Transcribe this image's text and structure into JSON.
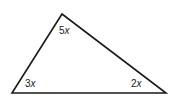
{
  "diagram": {
    "type": "triangle",
    "vertices": {
      "top": {
        "x": 62,
        "y": 14
      },
      "bottom_left": {
        "x": 12,
        "y": 93
      },
      "bottom_right": {
        "x": 166,
        "y": 93
      }
    },
    "angles": [
      {
        "vertex": "top",
        "coef": "5",
        "var": "x"
      },
      {
        "vertex": "bottom_left",
        "coef": "3",
        "var": "x"
      },
      {
        "vertex": "bottom_right",
        "coef": "2",
        "var": "x"
      }
    ],
    "stroke_color": "#1a1a1a"
  }
}
